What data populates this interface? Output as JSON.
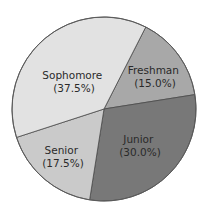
{
  "chart_data": {
    "type": "pie",
    "title": "",
    "categories": [
      "Freshman",
      "Junior",
      "Senior",
      "Sophomore"
    ],
    "values": [
      15.0,
      30.0,
      17.5,
      37.5
    ],
    "value_labels": [
      "(15.0%)",
      "(30.0%)",
      "(17.5%)",
      "(37.5%)"
    ],
    "colors": [
      "#a8a8a8",
      "#787878",
      "#cacaca",
      "#e2e2e2"
    ],
    "start_angle_deg": -63,
    "direction": "clockwise",
    "center": [
      104,
      109
    ],
    "radius": 92,
    "legend": "none",
    "labels_inside": true
  },
  "slices": [
    {
      "name": "Freshman",
      "pct": "(15.0%)",
      "color": "#a8a8a8",
      "label_x": 155,
      "label_y": 74
    },
    {
      "name": "Junior",
      "pct": "(30.0%)",
      "color": "#787878",
      "label_x": 140,
      "label_y": 143
    },
    {
      "name": "Senior",
      "pct": "(17.5%)",
      "color": "#cacaca",
      "label_x": 63,
      "label_y": 154
    },
    {
      "name": "Sophomore",
      "pct": "(37.5%)",
      "color": "#e2e2e2",
      "label_x": 74,
      "label_y": 79
    }
  ]
}
